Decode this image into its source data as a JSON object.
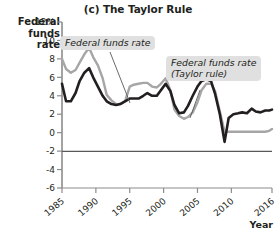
{
  "chart_data": {
    "type": "line",
    "title": "(c) The Taylor Rule",
    "ylabel": "Federal funds rate",
    "xlabel": "Year",
    "grid": false,
    "legend_position": "annotations-inline",
    "xlim": [
      1985,
      2016
    ],
    "ylim": [
      -6,
      12
    ],
    "yticks": [
      "12%",
      "10",
      "8",
      "6",
      "4",
      "2",
      "0",
      "-2",
      "-4",
      "-6"
    ],
    "ytick_values": [
      12,
      10,
      8,
      6,
      4,
      2,
      0,
      -2,
      -4,
      -6
    ],
    "xticks": [
      "1985",
      "1990",
      "1995",
      "2000",
      "2005",
      "2010",
      "2016"
    ],
    "xtick_values": [
      1985,
      1990,
      1995,
      2000,
      2005,
      2010,
      2016
    ],
    "zero_line": 0,
    "annotations": [
      {
        "id": "ffr",
        "text": "Federal funds rate",
        "target_series": "Federal funds rate"
      },
      {
        "id": "taylor",
        "line1": "Federal funds rate",
        "line2": "(Taylor rule)",
        "target_series": "Federal funds rate (Taylor rule)"
      }
    ],
    "series": [
      {
        "name": "Federal funds rate",
        "color": "#231f20",
        "x": [
          1985,
          1985.6,
          1986.3,
          1987,
          1987.6,
          1988.3,
          1989,
          1989.6,
          1990.3,
          1991,
          1991.6,
          1992.3,
          1993,
          1993.6,
          1994.3,
          1995,
          1995.6,
          1996.3,
          1997,
          1997.6,
          1998.3,
          1999,
          1999.6,
          2000.3,
          2001,
          2001.6,
          2002.3,
          2003,
          2003.6,
          2004.3,
          2005,
          2005.6,
          2006.3,
          2007,
          2007.6,
          2008.3,
          2009,
          2009.6,
          2010.3,
          2011,
          2011.6,
          2012.3,
          2013,
          2013.6,
          2014.3,
          2015,
          2015.6,
          2016
        ],
        "values": [
          5.3,
          3.4,
          3.4,
          4.3,
          5.6,
          6.5,
          7.0,
          6.0,
          5.0,
          4.0,
          3.4,
          3.1,
          3.0,
          3.1,
          3.4,
          3.7,
          3.7,
          3.7,
          4.0,
          4.3,
          4.0,
          4.0,
          4.6,
          5.3,
          4.5,
          3.0,
          2.1,
          2.2,
          2.9,
          4.0,
          5.0,
          5.6,
          5.8,
          5.6,
          4.2,
          2.0,
          -1.0,
          1.6,
          2.0,
          2.1,
          2.2,
          2.1,
          2.6,
          2.3,
          2.2,
          2.4,
          2.4,
          2.5
        ]
      },
      {
        "name": "Federal funds rate (Taylor rule)",
        "color": "#a6a6a6",
        "x": [
          1985,
          1985.6,
          1986.3,
          1987,
          1987.6,
          1988.3,
          1989,
          1989.6,
          1990.3,
          1991,
          1991.6,
          1992.3,
          1993,
          1993.6,
          1994.3,
          1995,
          1995.6,
          1996.3,
          1997,
          1997.6,
          1998.3,
          1999,
          1999.6,
          2000.3,
          2001,
          2001.6,
          2002.3,
          2003,
          2003.6,
          2004.3,
          2005,
          2005.6,
          2006.3,
          2007,
          2007.6,
          2008.3,
          2009,
          2009.6,
          2010.3,
          2011,
          2011.6,
          2012.3,
          2013,
          2013.6,
          2014.3,
          2015,
          2015.6,
          2016
        ],
        "values": [
          8.0,
          6.9,
          6.5,
          6.8,
          7.6,
          8.5,
          9.2,
          8.2,
          7.3,
          5.9,
          4.1,
          3.5,
          3.1,
          3.1,
          3.4,
          5.0,
          5.2,
          5.3,
          5.4,
          5.4,
          5.0,
          4.9,
          5.3,
          5.9,
          4.6,
          2.5,
          1.8,
          1.5,
          1.7,
          2.2,
          3.3,
          4.6,
          5.3,
          5.3,
          4.5,
          2.3,
          0.1,
          0.1,
          0.1,
          0.1,
          0.1,
          0.1,
          0.1,
          0.1,
          0.1,
          0.1,
          0.2,
          0.4
        ]
      }
    ]
  }
}
